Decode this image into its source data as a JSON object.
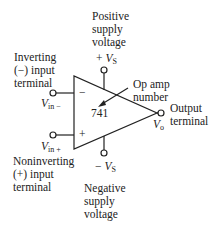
{
  "diagram": {
    "labels": {
      "positive_supply": [
        "Positive",
        "supply",
        "voltage"
      ],
      "positive_supply_symbol": {
        "sign": "+ ",
        "var": "V",
        "sub": "S"
      },
      "inverting_input": [
        "Inverting",
        "(−) input",
        "terminal"
      ],
      "vin_minus": {
        "var": "V",
        "sub": "in −"
      },
      "op_amp_number_label": [
        "Op amp",
        "number"
      ],
      "op_amp_number": "741",
      "output": [
        "Output",
        "terminal"
      ],
      "vo": {
        "var": "V",
        "sub": "o"
      },
      "vin_plus": {
        "var": "V",
        "sub": "in +"
      },
      "noninverting_input": [
        "Noninverting",
        "(+) input",
        "terminal"
      ],
      "negative_supply_symbol": {
        "sign": "− ",
        "var": "V",
        "sub": "S"
      },
      "negative_supply": [
        "Negative",
        "supply",
        "voltage"
      ],
      "minus_sign": "−",
      "plus_sign": "+"
    }
  }
}
